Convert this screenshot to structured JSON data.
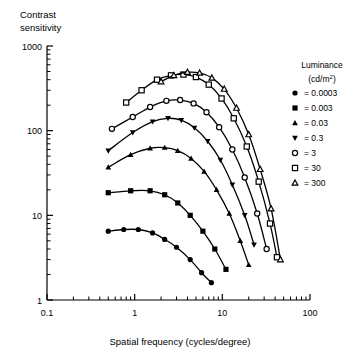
{
  "chart_data": {
    "type": "line",
    "title": "",
    "ylabel": "Contrast sensitivity",
    "ylabel_line1": "Contrast",
    "ylabel_line2": "sensitivity",
    "xlabel": "Spatial frequency (cycles/degree)",
    "xscale": "log",
    "yscale": "log",
    "xlim": [
      0.1,
      100
    ],
    "ylim": [
      1,
      1000
    ],
    "xticks": [
      0.1,
      1,
      10,
      100
    ],
    "xtick_labels": [
      "0.1",
      "1",
      "10",
      "100"
    ],
    "yticks": [
      1,
      10,
      100,
      1000
    ],
    "ytick_labels": [
      "1",
      "10",
      "100",
      "1000"
    ],
    "grid": false,
    "minor_ticks": true,
    "legend_position": "right",
    "legend_title_line1": "Luminance",
    "legend_title_line2": "(cd/m",
    "legend_title_sup": "2",
    "legend_title_line2_end": ")",
    "series": [
      {
        "name": "0.0003",
        "legend_label": "= 0.0003",
        "marker": "filled-circle",
        "filled": true,
        "points": [
          {
            "x": 0.5,
            "y": 6.5
          },
          {
            "x": 0.75,
            "y": 6.8
          },
          {
            "x": 1.1,
            "y": 6.8
          },
          {
            "x": 1.6,
            "y": 6.2
          },
          {
            "x": 2.2,
            "y": 5.2
          },
          {
            "x": 3.0,
            "y": 4.2
          },
          {
            "x": 4.3,
            "y": 3.0
          },
          {
            "x": 5.8,
            "y": 2.1
          },
          {
            "x": 7.5,
            "y": 1.6
          }
        ]
      },
      {
        "name": "0.003",
        "legend_label": "= 0.003",
        "marker": "filled-square",
        "filled": true,
        "points": [
          {
            "x": 0.5,
            "y": 18.5
          },
          {
            "x": 0.9,
            "y": 19.5
          },
          {
            "x": 1.5,
            "y": 19.5
          },
          {
            "x": 2.2,
            "y": 17.5
          },
          {
            "x": 3.1,
            "y": 14.0
          },
          {
            "x": 4.3,
            "y": 10.0
          },
          {
            "x": 6.0,
            "y": 6.5
          },
          {
            "x": 8.2,
            "y": 4.0
          },
          {
            "x": 11.0,
            "y": 2.3
          }
        ]
      },
      {
        "name": "0.03",
        "legend_label": "= 0.03",
        "marker": "filled-triangle-up",
        "filled": true,
        "points": [
          {
            "x": 0.5,
            "y": 37.0
          },
          {
            "x": 0.9,
            "y": 52.0
          },
          {
            "x": 1.5,
            "y": 62.0
          },
          {
            "x": 2.2,
            "y": 63.0
          },
          {
            "x": 3.1,
            "y": 58.0
          },
          {
            "x": 4.4,
            "y": 47.0
          },
          {
            "x": 6.2,
            "y": 33.0
          },
          {
            "x": 8.6,
            "y": 20.0
          },
          {
            "x": 12.0,
            "y": 10.5
          },
          {
            "x": 16.0,
            "y": 5.0
          },
          {
            "x": 20.0,
            "y": 2.6
          }
        ]
      },
      {
        "name": "0.3",
        "legend_label": "= 0.3",
        "marker": "filled-triangle-down",
        "filled": true,
        "points": [
          {
            "x": 0.5,
            "y": 58.0
          },
          {
            "x": 0.95,
            "y": 95.0
          },
          {
            "x": 1.6,
            "y": 128.0
          },
          {
            "x": 2.4,
            "y": 140.0
          },
          {
            "x": 3.4,
            "y": 133.0
          },
          {
            "x": 4.8,
            "y": 108.0
          },
          {
            "x": 6.8,
            "y": 75.0
          },
          {
            "x": 9.5,
            "y": 45.0
          },
          {
            "x": 13.0,
            "y": 23.0
          },
          {
            "x": 18.0,
            "y": 10.0
          },
          {
            "x": 23.0,
            "y": 4.5
          }
        ]
      },
      {
        "name": "3",
        "legend_label": "= 3",
        "marker": "open-circle",
        "filled": false,
        "points": [
          {
            "x": 0.55,
            "y": 105.0
          },
          {
            "x": 0.95,
            "y": 145.0
          },
          {
            "x": 1.5,
            "y": 190.0
          },
          {
            "x": 2.3,
            "y": 225.0
          },
          {
            "x": 3.3,
            "y": 230.0
          },
          {
            "x": 4.7,
            "y": 210.0
          },
          {
            "x": 6.6,
            "y": 165.0
          },
          {
            "x": 9.2,
            "y": 110.0
          },
          {
            "x": 13.0,
            "y": 60.0
          },
          {
            "x": 18.0,
            "y": 28.0
          },
          {
            "x": 25.0,
            "y": 10.5
          },
          {
            "x": 32.0,
            "y": 4.0
          }
        ]
      },
      {
        "name": "30",
        "legend_label": "= 30",
        "marker": "open-square",
        "filled": false,
        "points": [
          {
            "x": 0.8,
            "y": 215.0
          },
          {
            "x": 1.2,
            "y": 300.0
          },
          {
            "x": 1.8,
            "y": 400.0
          },
          {
            "x": 2.6,
            "y": 450.0
          },
          {
            "x": 3.6,
            "y": 460.0
          },
          {
            "x": 5.0,
            "y": 430.0
          },
          {
            "x": 7.0,
            "y": 350.0
          },
          {
            "x": 9.8,
            "y": 240.0
          },
          {
            "x": 13.5,
            "y": 140.0
          },
          {
            "x": 19.0,
            "y": 65.0
          },
          {
            "x": 26.0,
            "y": 25.0
          },
          {
            "x": 35.0,
            "y": 8.0
          },
          {
            "x": 42.0,
            "y": 3.2
          }
        ]
      },
      {
        "name": "300",
        "legend_label": "= 300",
        "marker": "open-triangle-up",
        "filled": false,
        "points": [
          {
            "x": 2.0,
            "y": 380.0
          },
          {
            "x": 2.8,
            "y": 450.0
          },
          {
            "x": 4.0,
            "y": 490.0
          },
          {
            "x": 5.5,
            "y": 480.0
          },
          {
            "x": 7.6,
            "y": 420.0
          },
          {
            "x": 10.5,
            "y": 310.0
          },
          {
            "x": 14.5,
            "y": 185.0
          },
          {
            "x": 20.0,
            "y": 90.0
          },
          {
            "x": 27.0,
            "y": 35.0
          },
          {
            "x": 36.0,
            "y": 12.0
          },
          {
            "x": 46.0,
            "y": 3.0
          }
        ]
      }
    ]
  }
}
